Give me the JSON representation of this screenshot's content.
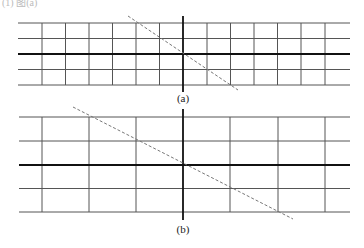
{
  "top_text": "(1) 图(a)",
  "colors": {
    "grid": "#555555",
    "axis": "#111111",
    "dash": "#777777",
    "background": "#ffffff"
  },
  "diagrams": [
    {
      "id": "a",
      "caption": "(a)",
      "caption_pos": [
        183,
        92
      ],
      "left": 18,
      "right": 350,
      "h_lines": [
        23,
        38.5,
        54,
        69.5,
        85
      ],
      "h_thick_index": 2,
      "v_lines": [
        42,
        65.5,
        89,
        112.5,
        136,
        159.5,
        207,
        230.5,
        254,
        277.5,
        301,
        325
      ],
      "axis": {
        "x": 183,
        "y1": 16,
        "y2": 92
      },
      "dashed_line": {
        "x1": 128,
        "y1": 16,
        "x2": 238,
        "y2": 90
      }
    },
    {
      "id": "b",
      "caption": "(b)",
      "caption_pos": [
        183,
        223
      ],
      "left": 19,
      "right": 350,
      "h_lines": [
        117,
        141,
        165,
        188.5,
        212
      ],
      "h_thick_index": 2,
      "v_lines": [
        42,
        89,
        136,
        230,
        278,
        325
      ],
      "axis": {
        "x": 183,
        "y1": 109,
        "y2": 220
      },
      "dashed_line": {
        "x1": 73,
        "y1": 107,
        "x2": 293,
        "y2": 219
      }
    }
  ]
}
